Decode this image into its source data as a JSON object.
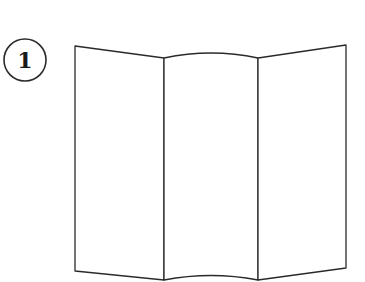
{
  "step": {
    "number": "1"
  },
  "figure": {
    "panels": 3,
    "stroke_color": "#2a2a2a",
    "fill_color": "#ffffff"
  }
}
